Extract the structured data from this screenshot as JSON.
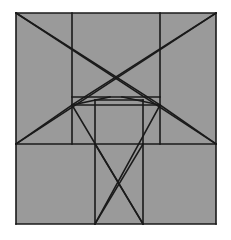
{
  "figure": {
    "canvas": {
      "width": 231,
      "height": 240,
      "background": "#ffffff"
    },
    "colors": {
      "fill": "#9a9a9a",
      "stroke": "#1a1a1a",
      "background": "#ffffff"
    },
    "stroke_width": 1.6,
    "outer_square": {
      "x": 16,
      "y": 13,
      "width": 200,
      "height": 211
    },
    "nodes": {
      "top_left": {
        "x": 16,
        "y": 13
      },
      "top_right": {
        "x": 216,
        "y": 13
      },
      "bottom_left": {
        "x": 16,
        "y": 224
      },
      "bottom_right": {
        "x": 216,
        "y": 224
      },
      "left_node": {
        "x": 72,
        "y": 105
      },
      "right_node": {
        "x": 160,
        "y": 105
      },
      "left_mid": {
        "x": 16,
        "y": 144
      },
      "right_mid": {
        "x": 216,
        "y": 144
      },
      "inner_bottom_left": {
        "x": 95,
        "y": 224
      },
      "inner_bottom_right": {
        "x": 143,
        "y": 224
      },
      "center_top_left": {
        "x": 95,
        "y": 100
      },
      "center_top_right": {
        "x": 143,
        "y": 100
      },
      "center_bottom_left": {
        "x": 95,
        "y": 144
      },
      "center_bottom_right": {
        "x": 143,
        "y": 144
      }
    },
    "segments": [
      {
        "name": "outer-border-top",
        "x1": 16,
        "y1": 13,
        "x2": 216,
        "y2": 13
      },
      {
        "name": "outer-border-right",
        "x1": 216,
        "y1": 13,
        "x2": 216,
        "y2": 224
      },
      {
        "name": "outer-border-bottom",
        "x1": 216,
        "y1": 224,
        "x2": 16,
        "y2": 224
      },
      {
        "name": "outer-border-left",
        "x1": 16,
        "y1": 224,
        "x2": 16,
        "y2": 13
      },
      {
        "name": "vertical-left-divider",
        "x1": 72,
        "y1": 13,
        "x2": 72,
        "y2": 144
      },
      {
        "name": "vertical-right-divider",
        "x1": 160,
        "y1": 13,
        "x2": 160,
        "y2": 144
      },
      {
        "name": "horizontal-mid-full",
        "x1": 16,
        "y1": 144,
        "x2": 216,
        "y2": 144
      },
      {
        "name": "band-top-edge",
        "x1": 72,
        "y1": 97,
        "x2": 160,
        "y2": 97
      },
      {
        "name": "band-bottom-edge",
        "x1": 72,
        "y1": 105,
        "x2": 160,
        "y2": 105
      },
      {
        "name": "center-square-top",
        "x1": 95,
        "y1": 100,
        "x2": 143,
        "y2": 100
      },
      {
        "name": "center-square-left",
        "x1": 95,
        "y1": 100,
        "x2": 95,
        "y2": 144
      },
      {
        "name": "center-square-right",
        "x1": 143,
        "y1": 100,
        "x2": 143,
        "y2": 144
      },
      {
        "name": "bottom-rect-left",
        "x1": 95,
        "y1": 144,
        "x2": 95,
        "y2": 224
      },
      {
        "name": "bottom-rect-right",
        "x1": 143,
        "y1": 144,
        "x2": 143,
        "y2": 224
      },
      {
        "name": "bottom-rect-diagonal-a",
        "x1": 95,
        "y1": 144,
        "x2": 143,
        "y2": 224
      },
      {
        "name": "bottom-rect-diagonal-b",
        "x1": 143,
        "y1": 144,
        "x2": 95,
        "y2": 224
      },
      {
        "name": "diagonal-topleft-to-rightnode",
        "x1": 16,
        "y1": 13,
        "x2": 160,
        "y2": 105
      },
      {
        "name": "diagonal-topright-to-leftnode",
        "x1": 216,
        "y1": 13,
        "x2": 72,
        "y2": 105
      },
      {
        "name": "diagonal-topleft-to-rightmid",
        "x1": 16,
        "y1": 13,
        "x2": 216,
        "y2": 144
      },
      {
        "name": "diagonal-topright-to-leftmid",
        "x1": 216,
        "y1": 13,
        "x2": 16,
        "y2": 144
      },
      {
        "name": "diagonal-leftnode-to-leftmid",
        "x1": 72,
        "y1": 105,
        "x2": 16,
        "y2": 144
      },
      {
        "name": "diagonal-rightnode-to-rightmid",
        "x1": 160,
        "y1": 105,
        "x2": 216,
        "y2": 144
      },
      {
        "name": "diagonal-leftnode-to-innerbottomright",
        "x1": 72,
        "y1": 105,
        "x2": 143,
        "y2": 224
      },
      {
        "name": "diagonal-rightnode-to-innerbottomleft",
        "x1": 160,
        "y1": 105,
        "x2": 95,
        "y2": 224
      },
      {
        "name": "diagonal-leftnode-to-bandtop-right",
        "x1": 72,
        "y1": 105,
        "x2": 110,
        "y2": 97
      },
      {
        "name": "diagonal-rightnode-to-bandtop-left",
        "x1": 160,
        "y1": 105,
        "x2": 122,
        "y2": 97
      }
    ]
  }
}
